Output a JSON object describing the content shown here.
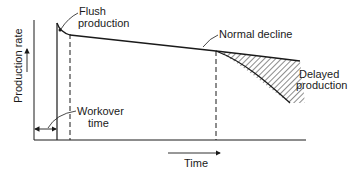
{
  "diagram": {
    "labels": {
      "flush_line1": "Flush",
      "flush_line2": "production",
      "normal_decline": "Normal decline",
      "delayed_line1": "Delayed",
      "delayed_line2": "production",
      "workover_line1": "Workover",
      "workover_line2": "time",
      "y_axis": "Production rate",
      "x_axis": "Time"
    },
    "colors": {
      "ink": "#1a1a1a",
      "background": "#ffffff"
    }
  }
}
